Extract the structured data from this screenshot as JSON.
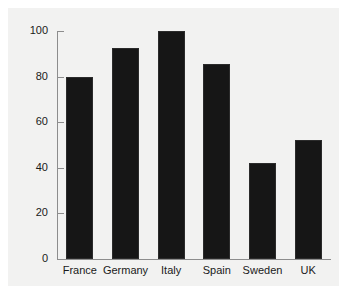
{
  "chart_data": {
    "type": "bar",
    "title": "",
    "subtitle": "",
    "xlabel": "",
    "ylabel": "",
    "categories": [
      "France",
      "Germany",
      "Italy",
      "Spain",
      "Sweden",
      "UK"
    ],
    "values": [
      80,
      92.5,
      100,
      85.5,
      42,
      52
    ],
    "series": [
      {
        "name": "",
        "values": [
          80,
          92.5,
          100,
          85.5,
          42,
          52
        ]
      }
    ],
    "ylim": [
      0,
      100
    ],
    "yticks": [
      0,
      20,
      40,
      60,
      80,
      100
    ],
    "ytick_labels": [
      "0",
      "20",
      "40",
      "60",
      "80",
      "100"
    ],
    "grid": false,
    "legend": false,
    "legend_position": "none",
    "annotations": [],
    "colors": {
      "bar_fill": "#161616",
      "bar_edge": "#2b2b2b",
      "axis": "#8d8d8d",
      "text": "#1a1a1a",
      "plot_background": "#f2f2f1",
      "figure_background": "#ffffff"
    }
  }
}
